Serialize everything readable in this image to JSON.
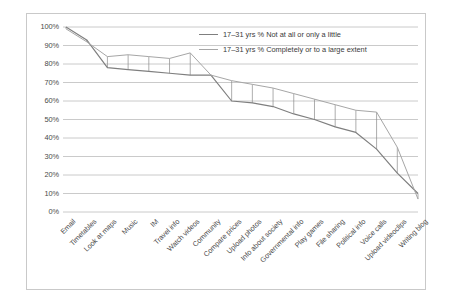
{
  "chart_data": {
    "type": "line",
    "title": "",
    "subtitle": "",
    "xlabel": "",
    "ylabel": "",
    "ylim": [
      0,
      100
    ],
    "grid": true,
    "legend_position": "top-right",
    "ytick_labels": [
      "100%",
      "90%",
      "80%",
      "70%",
      "60%",
      "50%",
      "40%",
      "30%",
      "20%",
      "10%",
      "0%"
    ],
    "ytick_values": [
      100,
      90,
      80,
      70,
      60,
      50,
      40,
      30,
      20,
      10,
      0
    ],
    "categories": [
      "Email",
      "Timetables",
      "Look at maps",
      "Music",
      "IM",
      "Travel info",
      "Watch videos",
      "Community",
      "Compare prices",
      "Upload photos",
      "Info about society",
      "Governmental info",
      "Play games",
      "File sharing",
      "Political info",
      "Voice calls",
      "Upload videoclips",
      "Writing blog"
    ],
    "series": [
      {
        "name": "17–31 yrs % Not at all or only a little",
        "color": "#7f7f7f",
        "values": [
          100,
          93,
          78,
          77,
          76,
          75,
          74,
          74,
          60,
          59,
          57,
          53,
          50,
          46,
          43,
          34,
          21,
          10
        ]
      },
      {
        "name": "17–31 yrs % Completely or to a large extent",
        "color": "#a6a6a6",
        "values": [
          99,
          92,
          84,
          85,
          84,
          83,
          86,
          74,
          71,
          69,
          67,
          64,
          61,
          58,
          55,
          54,
          35,
          7
        ]
      }
    ]
  },
  "legend": {
    "entries": [
      {
        "label": "17–31 yrs % Not at all or only a little",
        "color": "#7f7f7f"
      },
      {
        "label": "17–31 yrs % Completely or to a large extent",
        "color": "#a6a6a6"
      }
    ]
  },
  "colors": {
    "grid": "#bdbdbd",
    "border": "#c9c9c9",
    "text": "#4a4a4a",
    "background": "#ffffff"
  }
}
